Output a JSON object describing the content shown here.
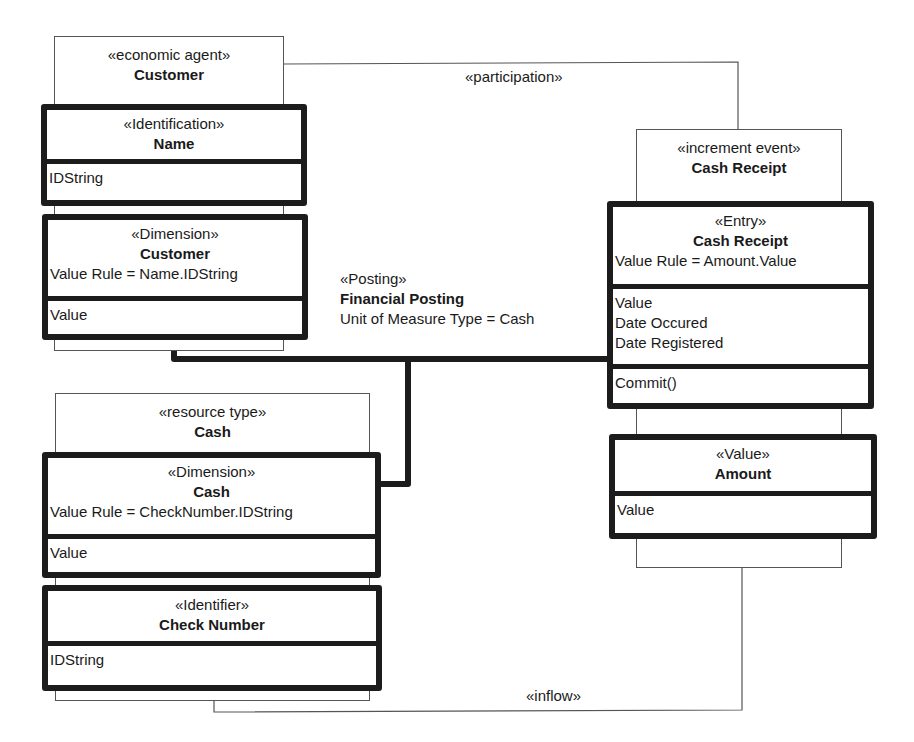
{
  "diagram": {
    "type": "uml-class-diagram",
    "colors": {
      "line": "#1c1c1c",
      "thin_line": "#555555",
      "background": "#ffffff"
    },
    "associations": [
      {
        "label": "«participation»",
        "from": "Customer",
        "to": "Cash Receipt"
      },
      {
        "label": "«inflow»",
        "from": "Cash Receipt",
        "to": "Cash"
      }
    ],
    "posting": {
      "stereotype": "«Posting»",
      "name": "Financial Posting",
      "rule": "Unit of Measure Type = Cash"
    },
    "classes": {
      "customer_agent": {
        "stereotype": "«economic agent»",
        "name": "Customer"
      },
      "customer_name": {
        "stereotype": "«Identification»",
        "name": "Name",
        "attributes": [
          "IDString"
        ]
      },
      "customer_dimension": {
        "stereotype": "«Dimension»",
        "name": "Customer",
        "rule": "Value Rule = Name.IDString",
        "attributes": [
          "Value"
        ]
      },
      "cash_resource": {
        "stereotype": "«resource type»",
        "name": "Cash"
      },
      "cash_dimension": {
        "stereotype": "«Dimension»",
        "name": "Cash",
        "rule": "Value Rule = CheckNumber.IDString",
        "attributes": [
          "Value"
        ]
      },
      "check_number": {
        "stereotype": "«Identifier»",
        "name": "Check Number",
        "attributes": [
          "IDString"
        ]
      },
      "cash_receipt_event": {
        "stereotype": "«increment event»",
        "name": "Cash Receipt"
      },
      "cash_receipt_entry": {
        "stereotype": "«Entry»",
        "name": "Cash Receipt",
        "rule": "Value Rule = Amount.Value",
        "attributes": [
          "Value",
          "Date Occured",
          "Date Registered"
        ],
        "operations": [
          "Commit()"
        ]
      },
      "amount": {
        "stereotype": "«Value»",
        "name": "Amount",
        "attributes": [
          "Value"
        ]
      }
    }
  }
}
